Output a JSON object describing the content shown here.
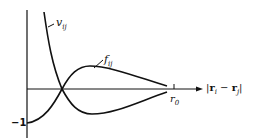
{
  "diagram": {
    "curves": [
      {
        "name": "v",
        "subscript": "ij",
        "label": "v_ij",
        "description": "repulsive potential, diverges at small r, decays to zero"
      },
      {
        "name": "f",
        "subscript": "ij",
        "label": "f_ij",
        "description": "Mayer function, starts at -1, crosses zero, peaks, decays to zero at r0"
      }
    ],
    "axis": {
      "x_label": "|r_i − r_j|",
      "x_label_parts": {
        "open": "|",
        "r1": "r",
        "sub1": "i",
        "minus": " − ",
        "r2": "r",
        "sub2": "j",
        "close": "|"
      },
      "x_tick_label": "r",
      "x_tick_sub": "0",
      "y_tick_label": "−1"
    },
    "labels": {
      "v_main": "v",
      "v_sub": "ij",
      "f_main": "f",
      "f_sub": "ij"
    }
  }
}
